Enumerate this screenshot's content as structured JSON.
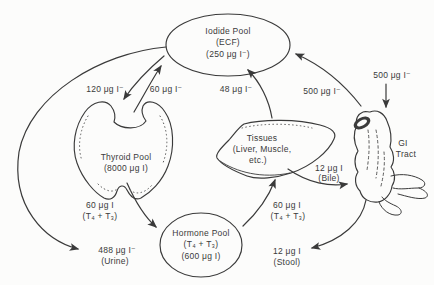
{
  "canvas": {
    "background": "#fcfcfb",
    "ink": "#3a3a3a"
  },
  "nodes": {
    "iodide_pool": {
      "lines": [
        "Iodide Pool",
        "(ECF)",
        "(250 μg I⁻)"
      ]
    },
    "thyroid_pool": {
      "lines": [
        "Thyroid Pool",
        "(8000 μg I)"
      ]
    },
    "tissues": {
      "lines": [
        "Tissues",
        "(Liver, Muscle,",
        "etc.)"
      ]
    },
    "gi_tract": {
      "lines": [
        "GI",
        "Tract"
      ]
    },
    "hormone_pool": {
      "lines": [
        "Hormone Pool",
        "(T₄ + T₃)",
        "(600 μg I)"
      ]
    }
  },
  "fluxes": {
    "thyroid_uptake": {
      "label": "120 μg I⁻"
    },
    "thyroid_return": {
      "label": "60 μg I⁻"
    },
    "tissue_return": {
      "label": "48 μg I⁻"
    },
    "gi_absorption": {
      "label": "500 μg I⁻"
    },
    "dietary_intake": {
      "label": "500 μg I⁻"
    },
    "thyroid_secretion": {
      "lines": [
        "60 μg I",
        "(T₄ + T₃)"
      ]
    },
    "tissue_uptake": {
      "lines": [
        "60 μg I",
        "(T₄ + T₃)"
      ]
    },
    "bile": {
      "lines": [
        "12 μg I",
        "(Bile)"
      ]
    },
    "urine": {
      "lines": [
        "488 μg I⁻",
        "(Urine)"
      ]
    },
    "stool": {
      "lines": [
        "12 μg I",
        "(Stool)"
      ]
    }
  }
}
